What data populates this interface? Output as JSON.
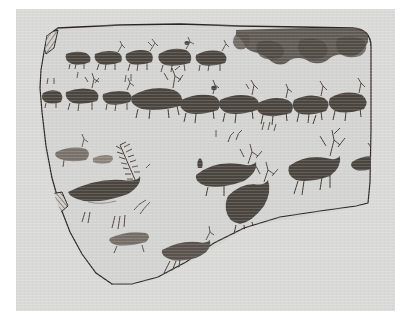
{
  "document": {
    "type": "archaeological-line-drawing",
    "subject": "rock art panel with cervid (deer) figures",
    "caption": "",
    "background_color": "#ffffff",
    "plate_color": "#d9d9d7",
    "ink_color": "#2a2622",
    "pigment_color": "#4a443e",
    "pigment_color_faded": "#8d877f"
  },
  "panel": {
    "name": "rock-panel-outline",
    "description": "irregular rock slab outline, rounded upper-right corner, curved lower edge",
    "stroke_color": "#2a2622",
    "stroke_width": 1.2,
    "fill_color": "#d3d3d1"
  },
  "damage_marks": [
    {
      "name": "hatched-notch-top-left",
      "description": "cross-hatched lens-shaped break mark at upper left corner",
      "x": 44,
      "y": 32,
      "width": 16,
      "height": 22
    },
    {
      "name": "hatched-notch-left-edge",
      "description": "cross-hatched polygonal break mark on lower left edge",
      "x": 38,
      "y": 192,
      "width": 28,
      "height": 26
    }
  ],
  "stain": {
    "name": "top-edge-pigment-band",
    "description": "broad dark weathered pigment band with lobed lower margin along the top right edge",
    "color": "#4f4843"
  },
  "figures": {
    "total_count": 28,
    "rows": [
      {
        "name": "row-upper-small-herd",
        "label": "upper row",
        "count": 5,
        "facing": "right",
        "note": "small solid-bodied deer, some with thin antlers"
      },
      {
        "name": "row-middle-large-herd",
        "label": "middle row",
        "count": 10,
        "facing": "right",
        "note": "larger solid deer bodies in procession, branching antlers on several"
      },
      {
        "name": "row-lower-scattered",
        "label": "lower scattered group",
        "count": 9,
        "facing": "mixed",
        "note": "faded and partial figures, comb-like antler rakes, long splayed legs"
      },
      {
        "name": "row-bottom-pair",
        "label": "bottom group",
        "count": 4,
        "facing": "mixed",
        "note": "small isolated deer near lower margin"
      }
    ]
  },
  "legend": {
    "hatching_means": "break / damaged edge",
    "solid_fill_means": "dark pigment",
    "light_fill_means": "faded pigment"
  }
}
